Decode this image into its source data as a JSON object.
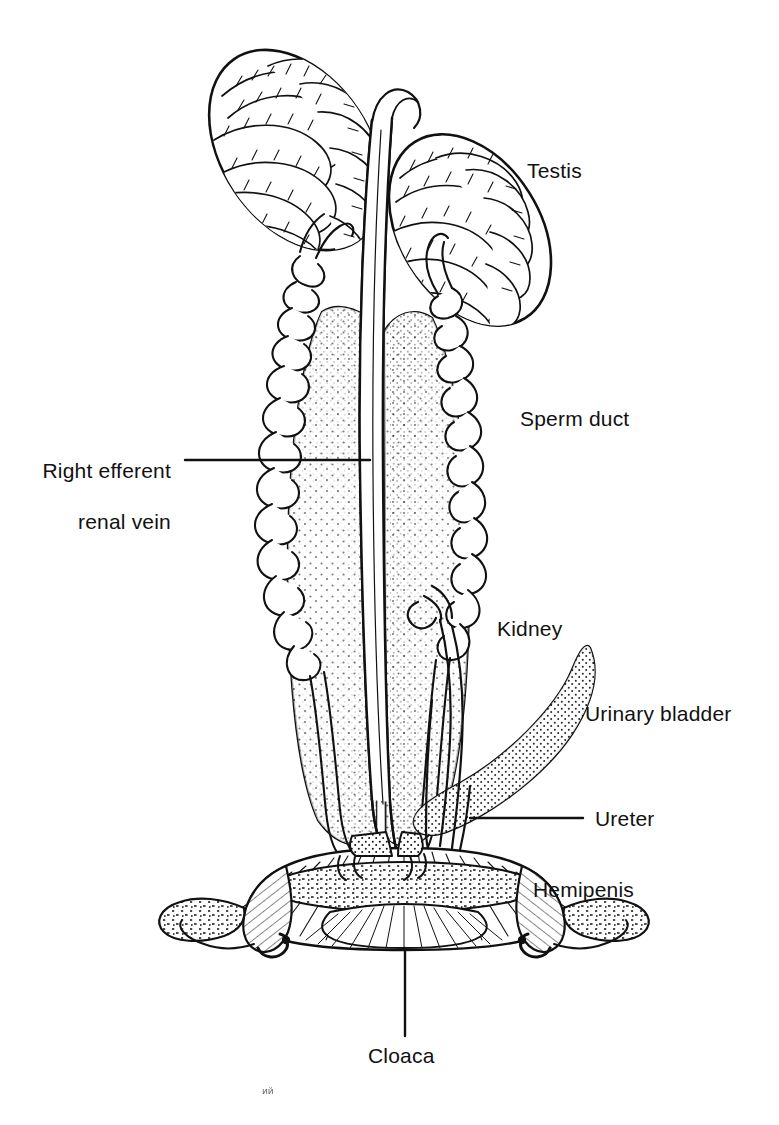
{
  "figure": {
    "style": "black ink line drawing on white background",
    "background_color": "#ffffff",
    "ink_color": "#111111",
    "width": 779,
    "height": 1125
  },
  "labels": [
    {
      "id": "testis",
      "text": "Testis",
      "x": 527,
      "y": 158,
      "align": "left",
      "leader": false
    },
    {
      "id": "right-efferent-renal-vein",
      "line1": "Right efferent",
      "line2": "renal vein",
      "text": "Right efferent renal vein",
      "x": 42,
      "y": 432,
      "align": "right",
      "leader": true,
      "leader_from_x": 185,
      "leader_to_x": 370,
      "leader_y": 460
    },
    {
      "id": "sperm-duct",
      "text": "Sperm duct",
      "x": 520,
      "y": 406,
      "align": "left",
      "leader": false
    },
    {
      "id": "kidney",
      "text": "Kidney",
      "x": 497,
      "y": 616,
      "align": "left",
      "leader": false
    },
    {
      "id": "urinary-bladder",
      "text": "Urinary bladder",
      "x": 585,
      "y": 701,
      "align": "left",
      "leader": false
    },
    {
      "id": "ureter",
      "text": "Ureter",
      "x": 595,
      "y": 806,
      "align": "left",
      "leader": true,
      "leader_from_x": 470,
      "leader_to_x": 583,
      "leader_y": 818
    },
    {
      "id": "hemipenis",
      "text": "Hemipenis",
      "x": 533,
      "y": 877,
      "align": "left",
      "leader": false
    },
    {
      "id": "cloaca",
      "text": "Cloaca",
      "x": 368,
      "y": 1043,
      "align": "left",
      "leader": true,
      "leader_x": 405,
      "leader_from_y": 948,
      "leader_to_y": 1036
    }
  ],
  "structures": [
    {
      "id": "left-testis",
      "name": "Testis (left)",
      "texture": "coiled seminiferous tubules"
    },
    {
      "id": "right-testis",
      "name": "Testis (right)",
      "texture": "coiled seminiferous tubules"
    },
    {
      "id": "left-sperm-duct",
      "name": "Sperm duct (left)",
      "texture": "convoluted tube"
    },
    {
      "id": "right-sperm-duct",
      "name": "Sperm duct (right)",
      "texture": "convoluted tube"
    },
    {
      "id": "left-kidney",
      "name": "Kidney (left)",
      "texture": "stipple"
    },
    {
      "id": "right-kidney",
      "name": "Kidney (right)",
      "texture": "stipple"
    },
    {
      "id": "efferent-renal-vein",
      "name": "Right efferent renal vein",
      "texture": "smooth vessel"
    },
    {
      "id": "urinary-bladder",
      "name": "Urinary bladder",
      "texture": "stipple"
    },
    {
      "id": "left-ureter",
      "name": "Ureter (left)",
      "texture": "thin tube"
    },
    {
      "id": "right-ureter",
      "name": "Ureter (right)",
      "texture": "thin tube"
    },
    {
      "id": "left-hemipenis",
      "name": "Hemipenis (left)",
      "texture": "hatched and granular"
    },
    {
      "id": "right-hemipenis",
      "name": "Hemipenis (right)",
      "texture": "hatched and granular"
    },
    {
      "id": "cloaca",
      "name": "Cloaca",
      "texture": "radiating hatch lines"
    }
  ],
  "artifact": {
    "text": "ий",
    "x": 262,
    "y": 1086
  }
}
